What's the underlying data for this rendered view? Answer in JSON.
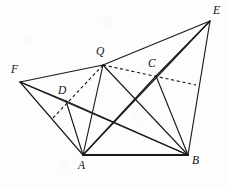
{
  "figure": {
    "type": "geometry-diagram",
    "background_color": "#fdfdfd",
    "stroke_color": "#1a1a1a",
    "width": 229,
    "height": 188
  },
  "points": [
    {
      "id": "A",
      "label": "A",
      "x": 83,
      "y": 155,
      "label_x": 78,
      "label_y": 160
    },
    {
      "id": "B",
      "label": "B",
      "x": 188,
      "y": 155,
      "label_x": 192,
      "label_y": 155
    },
    {
      "id": "C",
      "label": "C",
      "x": 156,
      "y": 76,
      "label_x": 148,
      "label_y": 58
    },
    {
      "id": "D",
      "label": "D",
      "x": 66,
      "y": 101,
      "label_x": 58,
      "label_y": 85
    },
    {
      "id": "E",
      "label": "E",
      "x": 210,
      "y": 21,
      "label_x": 213,
      "label_y": 5
    },
    {
      "id": "F",
      "label": "F",
      "x": 20,
      "y": 82,
      "label_x": 11,
      "label_y": 64
    },
    {
      "id": "Q",
      "label": "Q",
      "x": 103,
      "y": 65,
      "label_x": 96,
      "label_y": 46
    }
  ],
  "edges_solid": [
    {
      "from": "F",
      "to": "Q",
      "name": "segment-FQ"
    },
    {
      "from": "Q",
      "to": "E",
      "name": "segment-QE"
    },
    {
      "from": "F",
      "to": "D",
      "name": "segment-FD"
    },
    {
      "from": "F",
      "to": "A",
      "name": "segment-FA"
    },
    {
      "from": "F",
      "to": "B",
      "name": "segment-FB"
    },
    {
      "from": "D",
      "to": "A",
      "name": "segment-DA"
    },
    {
      "from": "D",
      "to": "B",
      "name": "segment-DB"
    },
    {
      "from": "Q",
      "to": "A",
      "name": "segment-QA"
    },
    {
      "from": "Q",
      "to": "B",
      "name": "segment-QB"
    },
    {
      "from": "C",
      "to": "A",
      "name": "segment-CA"
    },
    {
      "from": "C",
      "to": "B",
      "name": "segment-CB"
    },
    {
      "from": "C",
      "to": "E",
      "name": "segment-CE"
    },
    {
      "from": "E",
      "to": "A",
      "name": "segment-EA"
    },
    {
      "from": "E",
      "to": "B",
      "name": "segment-EB"
    }
  ],
  "edges_base": [
    {
      "from": "A",
      "to": "B",
      "name": "segment-AB"
    }
  ],
  "edges_dashed": [
    {
      "from_x": 53,
      "from_y": 118,
      "to_x": 103,
      "to_y": 65,
      "name": "dashed-through-D"
    },
    {
      "from_x": 103,
      "from_y": 65,
      "to_x": 196,
      "to_y": 85,
      "name": "dashed-through-C"
    }
  ]
}
